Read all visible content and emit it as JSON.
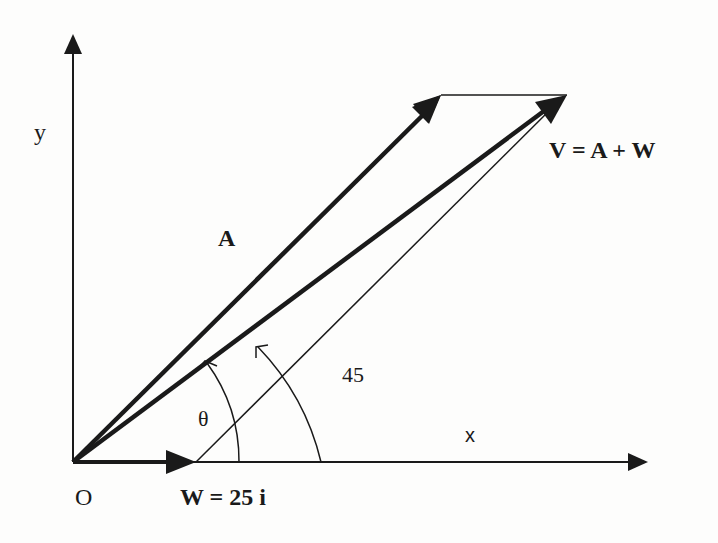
{
  "diagram": {
    "type": "vector-addition",
    "labels": {
      "y_axis": "y",
      "x_axis": "x",
      "origin": "O",
      "vector_a": "A",
      "resultant": "V = A + W",
      "wind": "W = 25 i",
      "theta": "θ",
      "angle_45": "45"
    },
    "colors": {
      "ink": "#1a1a1a",
      "background": "#fdfdfc"
    },
    "geometry": {
      "origin": [
        73,
        462
      ],
      "y_axis_tip": [
        73,
        34
      ],
      "x_axis_tip": [
        648,
        462
      ],
      "w_tip": [
        196,
        462
      ],
      "a_tip": [
        441,
        95
      ],
      "v_tip": [
        567,
        95
      ],
      "theta_arc_radius": 166,
      "angle45_arc_radius": 248
    }
  }
}
